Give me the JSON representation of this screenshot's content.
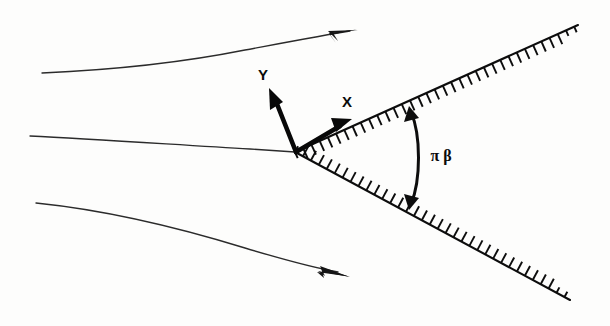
{
  "figure": {
    "background_color": "#fdfdfc",
    "ink_color": "#0d0d0d",
    "width": 610,
    "height": 326
  },
  "labels": {
    "x_axis": "X",
    "y_axis": "Y",
    "wedge_angle": "π β"
  },
  "chart_data": {
    "type": "diagram",
    "apex": {
      "x": 295,
      "y": 152
    },
    "wedge": {
      "half_angle_deg": 26,
      "included_angle_deg": 52,
      "angle_label": "π β",
      "upper_edge": {
        "from": [
          295,
          152
        ],
        "to": [
          578,
          25
        ],
        "angle_deg": -24.2
      },
      "lower_edge": {
        "from": [
          295,
          152
        ],
        "to": [
          570,
          300
        ],
        "angle_deg": 28.3
      },
      "hatching": {
        "side": "interior",
        "tick_length": 11,
        "tick_spacing": 9,
        "description": "perpendicular hatch ticks on the inner face of both wedge surfaces"
      }
    },
    "axes": {
      "x": {
        "label": "X",
        "origin": [
          295,
          152
        ],
        "tip": [
          349,
          121
        ],
        "label_pos": [
          353,
          101
        ],
        "direction": "along upper wedge surface, up-right"
      },
      "y": {
        "label": "Y",
        "origin": [
          295,
          152
        ],
        "tip": [
          270,
          89
        ],
        "label_pos": [
          266,
          78
        ],
        "direction": "normal to upper wedge surface, up-left"
      }
    },
    "angle_arc": {
      "label": "π β",
      "label_pos": [
        441,
        155
      ],
      "from": [
        412,
        110
      ],
      "to": [
        412,
        206
      ],
      "double_headed": true,
      "bulge": "right"
    },
    "streamlines": [
      {
        "name": "upper-streamline",
        "start": [
          42,
          73
        ],
        "end": [
          357,
          34
        ],
        "arrow": true,
        "curvature": "deflected upward, away from wedge"
      },
      {
        "name": "stagnation-streamline",
        "start": [
          30,
          136
        ],
        "end": [
          295,
          152
        ],
        "arrow": false,
        "curvature": "nearly straight, terminates on the wedge apex"
      },
      {
        "name": "lower-streamline",
        "start": [
          36,
          203
        ],
        "end": [
          348,
          272
        ],
        "arrow": true,
        "curvature": "deflected downward, away from wedge"
      }
    ]
  }
}
